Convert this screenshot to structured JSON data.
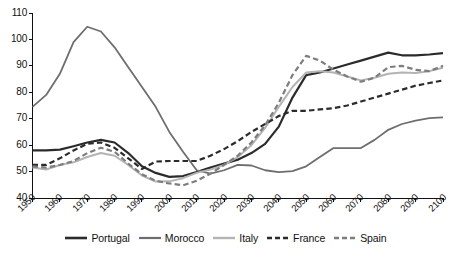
{
  "chart_data": {
    "type": "line",
    "title": "",
    "subtitle": "",
    "xlabel": "",
    "ylabel": "",
    "xlim": [
      1950,
      2100
    ],
    "ylim": [
      40,
      110
    ],
    "grid": false,
    "legend_position": "bottom",
    "x_ticks": [
      "1950",
      "1960",
      "1970",
      "1980",
      "1990",
      "2000",
      "2010",
      "2020",
      "2030",
      "2040",
      "2050",
      "2060",
      "2070",
      "2080",
      "2090",
      "2100"
    ],
    "y_ticks": [
      "110",
      "100",
      "90",
      "80",
      "70",
      "60",
      "50",
      "40"
    ],
    "x": [
      1950,
      1955,
      1960,
      1965,
      1970,
      1975,
      1980,
      1985,
      1990,
      1995,
      2000,
      2005,
      2010,
      2015,
      2020,
      2025,
      2030,
      2035,
      2040,
      2045,
      2050,
      2055,
      2060,
      2065,
      2070,
      2075,
      2080,
      2085,
      2090,
      2095,
      2100
    ],
    "series": [
      {
        "name": "Portugal",
        "style": "solid",
        "color": "#2b2b2b",
        "width": 2.2,
        "values": [
          58.0,
          58.0,
          58.3,
          59.6,
          61.0,
          62.0,
          61.0,
          57.0,
          52.0,
          49.5,
          48.0,
          48.3,
          49.8,
          51.5,
          53.0,
          54.5,
          57.0,
          60.5,
          67.0,
          78.0,
          86.5,
          87.5,
          89.0,
          90.5,
          92.0,
          93.5,
          95.0,
          94.0,
          94.0,
          94.3,
          94.8
        ]
      },
      {
        "name": "Morocco",
        "style": "solid",
        "color": "#6e6e6e",
        "width": 1.8,
        "values": [
          74.5,
          79.0,
          87.0,
          99.0,
          104.8,
          103.0,
          97.0,
          89.5,
          82.0,
          74.5,
          65.0,
          57.5,
          50.5,
          49.2,
          50.5,
          52.5,
          52.3,
          50.5,
          49.8,
          50.2,
          52.0,
          55.5,
          58.9,
          58.9,
          58.9,
          62.0,
          65.8,
          68.0,
          69.3,
          70.2,
          70.5
        ]
      },
      {
        "name": "Italy",
        "style": "solid",
        "color": "#b4b4b4",
        "width": 2.0,
        "values": [
          51.5,
          50.8,
          52.5,
          53.5,
          55.5,
          57.0,
          56.0,
          52.5,
          48.5,
          46.2,
          46.3,
          47.5,
          49.5,
          50.8,
          52.5,
          55.5,
          60.0,
          66.5,
          74.5,
          82.0,
          87.5,
          88.0,
          87.5,
          86.0,
          84.5,
          85.5,
          87.0,
          87.5,
          87.3,
          88.0,
          89.3
        ]
      },
      {
        "name": "France",
        "style": "dashed",
        "color": "#2b2b2b",
        "width": 2.2,
        "values": [
          52.5,
          52.5,
          55.0,
          58.0,
          60.5,
          61.0,
          59.0,
          55.0,
          51.0,
          53.8,
          54.0,
          54.0,
          54.0,
          56.0,
          58.5,
          61.5,
          65.0,
          68.0,
          71.0,
          73.0,
          73.0,
          73.5,
          74.0,
          75.0,
          76.5,
          78.0,
          79.5,
          81.0,
          82.5,
          83.5,
          84.5
        ]
      },
      {
        "name": "Spain",
        "style": "dashed",
        "color": "#7d7d7d",
        "width": 2.2,
        "values": [
          52.0,
          51.5,
          52.5,
          54.0,
          57.0,
          59.0,
          57.5,
          53.0,
          49.0,
          46.5,
          45.5,
          44.8,
          46.5,
          49.2,
          52.5,
          56.0,
          61.0,
          67.5,
          76.0,
          86.5,
          93.8,
          92.0,
          88.5,
          86.0,
          84.0,
          85.5,
          89.5,
          90.0,
          88.5,
          88.0,
          90.0
        ]
      }
    ]
  },
  "legend": {
    "items": [
      {
        "label": "Portugal"
      },
      {
        "label": "Morocco"
      },
      {
        "label": "Italy"
      },
      {
        "label": "France"
      },
      {
        "label": "Spain"
      }
    ]
  }
}
